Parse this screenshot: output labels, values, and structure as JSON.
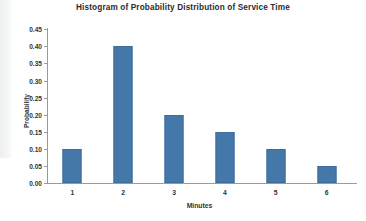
{
  "chart_data": {
    "type": "bar",
    "title": "Histogram of Probability Distribution of Service Time",
    "xlabel": "Minutes",
    "ylabel": "Probability",
    "categories": [
      "1",
      "2",
      "3",
      "4",
      "5",
      "6"
    ],
    "values": [
      0.1,
      0.4,
      0.2,
      0.15,
      0.1,
      0.05
    ],
    "ylim": [
      0.0,
      0.45
    ],
    "ytick_step": 0.05,
    "ytick_labels": [
      "0.00",
      "0.05",
      "0.10",
      "0.15",
      "0.20",
      "0.25",
      "0.30",
      "0.35",
      "0.40",
      "0.45"
    ],
    "ytick_values": [
      0.0,
      0.05,
      0.1,
      0.15,
      0.2,
      0.25,
      0.3,
      0.35,
      0.4,
      0.45
    ],
    "grid": false,
    "legend": false,
    "bar_color": "#4478a8",
    "axis_color": "#9a9a9a",
    "title_color": "#2b2b2b",
    "label_color": "#333333",
    "background": "#ffffff"
  }
}
